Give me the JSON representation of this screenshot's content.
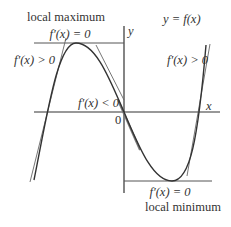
{
  "diagram": {
    "title": "y = f(x)",
    "axes": {
      "x_label": "x",
      "y_label": "y",
      "origin_label": "0"
    },
    "annotations": {
      "local_max_title": "local maximum",
      "local_max_derivative": "f′(x) = 0",
      "increasing_left": "f′(x) > 0",
      "decreasing": "f′(x) < 0",
      "increasing_right": "f′(x) > 0",
      "local_min_derivative": "f′(x) = 0",
      "local_min_title": "local minimum"
    },
    "colors": {
      "curve": "#333333",
      "axes": "#333333",
      "tangent": "#555555",
      "guide": "#666666",
      "text": "#333333"
    }
  }
}
